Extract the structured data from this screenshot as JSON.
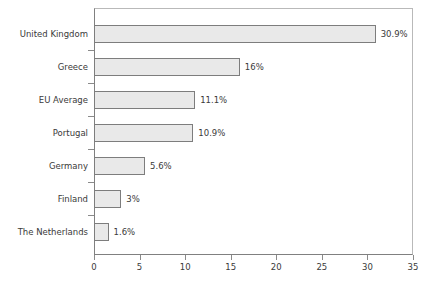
{
  "chart_data": {
    "type": "bar",
    "orientation": "horizontal",
    "title": "",
    "subtitle": "",
    "xlabel": "",
    "ylabel": "",
    "xlim": [
      0,
      35
    ],
    "xticks": [
      0,
      5,
      10,
      15,
      20,
      25,
      30,
      35
    ],
    "xtick_labels": [
      "0",
      "5",
      "10",
      "15",
      "20",
      "25",
      "30",
      "35"
    ],
    "grid": false,
    "legend": null,
    "categories": [
      "United Kingdom",
      "Greece",
      "EU Average",
      "Portugal",
      "Germany",
      "Finland",
      "The Netherlands"
    ],
    "values": [
      30.9,
      16,
      11.1,
      10.9,
      5.6,
      3,
      1.6
    ],
    "value_labels": [
      "30.9%",
      "16%",
      "11.1%",
      "10.9%",
      "5.6%",
      "3%",
      "1.6%"
    ],
    "series": [
      {
        "name": "",
        "values": [
          30.9,
          16,
          11.1,
          10.9,
          5.6,
          3,
          1.6
        ]
      }
    ]
  },
  "style": {
    "bar_fill": "#e9e9e9",
    "bar_stroke": "#7d7d7d",
    "axis_color": "#808080",
    "frame_color": "#b9b9b9",
    "text_color": "#3a3a3a",
    "background": "#ffffff"
  }
}
